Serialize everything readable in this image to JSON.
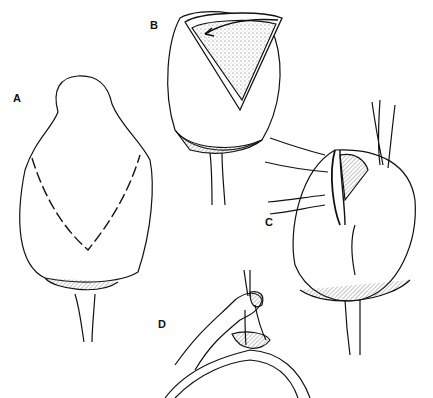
{
  "figure": {
    "type": "surgical illustration",
    "panels": [
      {
        "id": "A",
        "label": "A",
        "description": "Organ with dashed V-shaped incision line"
      },
      {
        "id": "B",
        "label": "B",
        "description": "V-shaped flap opened, arrow indicating flap rotation"
      },
      {
        "id": "C",
        "label": "C",
        "description": "Flap sutured in place with traction sutures"
      },
      {
        "id": "D",
        "label": "D",
        "description": "Close-up detail of flap attachment and suture"
      }
    ],
    "colors": {
      "line": "#111111",
      "background": "#ffffff",
      "hatch": "#555555"
    }
  }
}
